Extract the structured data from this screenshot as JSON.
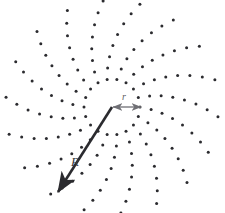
{
  "figure": {
    "background_color": "#ffffff",
    "width": 225,
    "height": 213
  },
  "pattern": {
    "name": "spiral-dot-array",
    "type": "radial-spiral-scatter",
    "center_x": 112,
    "center_y": 107,
    "arm_count": 18,
    "dots_per_arm": 8,
    "angle_step_degrees": 20,
    "first_dot_radius": 28,
    "dot_radius_step": 11.2,
    "spiral_twist_degrees_per_dot": -3.6,
    "dot_size_px": 3.0,
    "dot_color": "#2b2b2f"
  },
  "vectors": {
    "outer": {
      "name": "R",
      "label": "R",
      "label_x": 75,
      "label_y": 166,
      "start_x": 112,
      "start_y": 107,
      "end_x": 58,
      "end_y": 192,
      "color": "#2b2b2f",
      "arrowhead": "single-end",
      "stroke_width": 2.6
    },
    "inner": {
      "name": "r",
      "label": "r",
      "label_x": 124,
      "label_y": 100,
      "start_x": 113,
      "start_y": 107,
      "end_x": 141,
      "end_y": 107,
      "color": "#6f6f74",
      "arrowhead": "double-ended",
      "stroke_width": 1.3
    }
  }
}
